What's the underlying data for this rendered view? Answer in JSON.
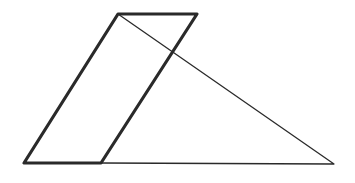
{
  "diagram": {
    "type": "geometry",
    "background": "#ffffff",
    "stroke_color": "#2a2a2a",
    "parallelogram": {
      "vertices": [
        [
          24,
          163
        ],
        [
          101,
          163
        ],
        [
          197,
          14
        ],
        [
          118,
          14
        ]
      ],
      "stroke_width": 3.2
    },
    "triangle": {
      "vertices": [
        [
          118,
          14
        ],
        [
          334,
          164
        ],
        [
          101,
          163
        ]
      ],
      "stroke_width": 1.3
    },
    "labels": []
  }
}
